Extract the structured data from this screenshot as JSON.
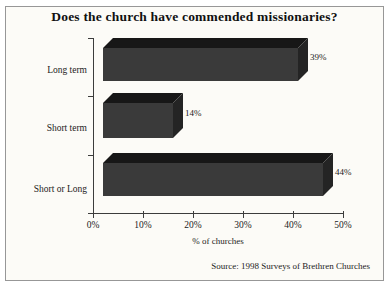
{
  "chart_data": {
    "type": "bar",
    "orientation": "horizontal",
    "style": "3d",
    "title": "Does the church have commended missionaries?",
    "categories": [
      "Long term",
      "Short term",
      "Short or Long"
    ],
    "values": [
      39,
      14,
      44
    ],
    "value_labels": [
      "39%",
      "14%",
      "44%"
    ],
    "xlabel": "% of churches",
    "ylabel": "",
    "x_ticks": [
      "0%",
      "10%",
      "20%",
      "30%",
      "40%",
      "50%"
    ],
    "xlim": [
      0,
      50
    ],
    "grid": false,
    "legend": false,
    "source": "Source: 1998 Surveys of Brethren Churches",
    "colors": {
      "bar_front": "#3a3a3a",
      "bar_top": "#171717",
      "bar_side": "#242424",
      "axis": "#3c3c3c",
      "frame_border": "#979797",
      "frame_background": "#fcfbf7",
      "text": "#1c1c1c"
    }
  }
}
